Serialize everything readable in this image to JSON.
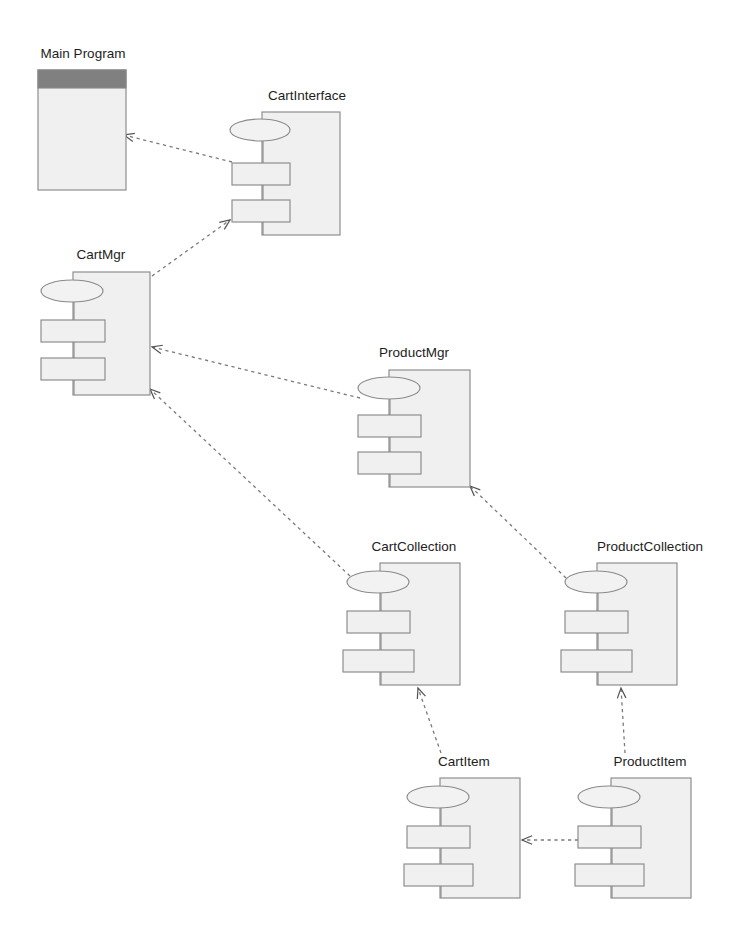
{
  "diagram": {
    "type": "uml-component-diagram",
    "canvas": {
      "width": 743,
      "height": 941,
      "background": "#ffffff"
    },
    "style": {
      "component_fill": "#f0f0f0",
      "component_stroke": "#8a8a8a",
      "node_header_fill": "#808080",
      "dependency_stroke": "#7a7a7a",
      "label_color": "#1d1d1d"
    },
    "components": [
      {
        "id": "main-program",
        "label": "Main Program",
        "shape": "node-box",
        "label_x": 83,
        "label_y": 58,
        "x": 38,
        "y": 70,
        "w": 88,
        "h": 120,
        "header_h": 18
      },
      {
        "id": "cart-interface",
        "label": "CartInterface",
        "shape": "component",
        "label_x": 307,
        "label_y": 100,
        "x": 262,
        "y": 112,
        "w": 78,
        "h": 123,
        "ellipse_cx": 260,
        "ellipse_cy": 130,
        "ellipse_rx": 30,
        "ellipse_ry": 11,
        "tab1_x": 232,
        "tab1_y": 163,
        "tab_w": 58,
        "tab_h": 22,
        "tab2_x": 232,
        "tab2_y": 200
      },
      {
        "id": "cart-mgr",
        "label": "CartMgr",
        "shape": "component",
        "label_x": 101,
        "label_y": 259,
        "x": 73,
        "y": 272,
        "w": 77,
        "h": 123,
        "ellipse_cx": 72,
        "ellipse_cy": 291,
        "ellipse_rx": 31,
        "ellipse_ry": 11,
        "tab1_x": 41,
        "tab1_y": 320,
        "tab_w": 64,
        "tab_h": 22,
        "tab2_x": 41,
        "tab2_y": 358
      },
      {
        "id": "product-mgr",
        "label": "ProductMgr",
        "shape": "component",
        "label_x": 414,
        "label_y": 357,
        "x": 389,
        "y": 370,
        "w": 81,
        "h": 117,
        "ellipse_cx": 389,
        "ellipse_cy": 388,
        "ellipse_rx": 31,
        "ellipse_ry": 11,
        "tab1_x": 358,
        "tab1_y": 415,
        "tab_w": 63,
        "tab_h": 22,
        "tab2_x": 358,
        "tab2_y": 452
      },
      {
        "id": "cart-collection",
        "label": "CartCollection",
        "shape": "component",
        "label_x": 414,
        "label_y": 551,
        "x": 380,
        "y": 563,
        "w": 80,
        "h": 122,
        "ellipse_cx": 378,
        "ellipse_cy": 582,
        "ellipse_rx": 31,
        "ellipse_ry": 11,
        "tab1_x": 347,
        "tab1_y": 611,
        "tab_w": 63,
        "tab_h": 22,
        "tab2_x": 343,
        "tab2_y": 650,
        "tab2_w": 71
      },
      {
        "id": "product-collection",
        "label": "ProductCollection",
        "shape": "component",
        "label_x": 650,
        "label_y": 551,
        "x": 597,
        "y": 563,
        "w": 80,
        "h": 122,
        "ellipse_cx": 596,
        "ellipse_cy": 582,
        "ellipse_rx": 31,
        "ellipse_ry": 11,
        "tab1_x": 565,
        "tab1_y": 611,
        "tab_w": 63,
        "tab_h": 22,
        "tab2_x": 561,
        "tab2_y": 650,
        "tab2_w": 71
      },
      {
        "id": "cart-item",
        "label": "CartItem",
        "shape": "component",
        "label_x": 464,
        "label_y": 766,
        "x": 440,
        "y": 778,
        "w": 80,
        "h": 120,
        "ellipse_cx": 438,
        "ellipse_cy": 797,
        "ellipse_rx": 31,
        "ellipse_ry": 11,
        "tab1_x": 407,
        "tab1_y": 826,
        "tab_w": 63,
        "tab_h": 22,
        "tab2_x": 404,
        "tab2_y": 864,
        "tab2_w": 69
      },
      {
        "id": "product-item",
        "label": "ProductItem",
        "shape": "component",
        "label_x": 650,
        "label_y": 766,
        "x": 611,
        "y": 778,
        "w": 80,
        "h": 120,
        "ellipse_cx": 609,
        "ellipse_cy": 797,
        "ellipse_rx": 31,
        "ellipse_ry": 11,
        "tab1_x": 578,
        "tab1_y": 826,
        "tab_w": 63,
        "tab_h": 22,
        "tab2_x": 575,
        "tab2_y": 864,
        "tab2_w": 69
      }
    ],
    "dependencies": [
      {
        "id": "dep-cartinterface-to-mainprogram",
        "from": "cart-interface",
        "to": "main-program",
        "x1": 232,
        "y1": 162,
        "x2": 124,
        "y2": 135
      },
      {
        "id": "dep-cartmgr-to-cartinterface",
        "from": "cart-mgr",
        "to": "cart-interface",
        "x1": 152,
        "y1": 276,
        "x2": 230,
        "y2": 220
      },
      {
        "id": "dep-productmgr-to-cartmgr",
        "from": "product-mgr",
        "to": "cart-mgr",
        "x1": 360,
        "y1": 398,
        "x2": 152,
        "y2": 347
      },
      {
        "id": "dep-cartcollection-to-cartmgr",
        "from": "cart-collection",
        "to": "cart-mgr",
        "x1": 350,
        "y1": 576,
        "x2": 150,
        "y2": 389
      },
      {
        "id": "dep-productcollection-to-productmgr",
        "from": "product-collection",
        "to": "product-mgr",
        "x1": 566,
        "y1": 578,
        "x2": 470,
        "y2": 486
      },
      {
        "id": "dep-cartitem-to-cartcollection",
        "from": "cart-item",
        "to": "cart-collection",
        "x1": 441,
        "y1": 753,
        "x2": 418,
        "y2": 688
      },
      {
        "id": "dep-productitem-to-productcollection",
        "from": "product-item",
        "to": "product-collection",
        "x1": 625,
        "y1": 753,
        "x2": 621,
        "y2": 688
      },
      {
        "id": "dep-productitem-to-cartitem",
        "from": "product-item",
        "to": "cart-item",
        "x1": 578,
        "y1": 840,
        "x2": 522,
        "y2": 840
      }
    ]
  }
}
